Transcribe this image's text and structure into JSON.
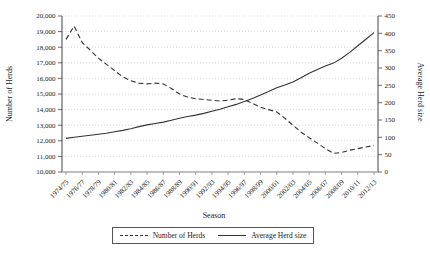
{
  "chart_data": {
    "type": "line",
    "xlabel": "Season",
    "ylabel_left": "Number of Herds",
    "ylabel_right": "Average Herd size",
    "grid": "dotted-horizontal",
    "legend_position": "bottom-center-boxed",
    "colors": {
      "line": "#333333",
      "grid": "#c9c9c9",
      "axis": "#444444",
      "bottom_axis": "#aaaaaa",
      "background": "#ffffff"
    },
    "x_categories": [
      "1974/75",
      "1975/76",
      "1976/77",
      "1977/78",
      "1978/79",
      "1979/80",
      "1980/81",
      "1981/82",
      "1982/83",
      "1983/84",
      "1984/85",
      "1985/86",
      "1986/87",
      "1987/88",
      "1988/89",
      "1989/90",
      "1990/91",
      "1991/92",
      "1992/93",
      "1993/94",
      "1994/95",
      "1995/96",
      "1996/97",
      "1997/98",
      "1998/99",
      "1999/00",
      "2000/01",
      "2001/02",
      "2002/03",
      "2003/04",
      "2004/05",
      "2005/06",
      "2006/07",
      "2007/08",
      "2008/09",
      "2009/10",
      "2010/11",
      "2011/12",
      "2012/13"
    ],
    "x_tick_labels": [
      "1974/75",
      "1976/77",
      "1978/79",
      "1980/81",
      "1982/83",
      "1984/85",
      "1986/87",
      "1988/89",
      "1990/91",
      "1992/93",
      "1994/95",
      "1996/97",
      "1998/99",
      "2000/01",
      "2002/03",
      "2004/05",
      "2006/07",
      "2008/09",
      "2010/11",
      "2012/13"
    ],
    "y_left": {
      "min": 10000,
      "max": 20000,
      "step": 1000,
      "tick_labels": [
        "10,000",
        "11,000",
        "12,000",
        "13,000",
        "14,000",
        "15,000",
        "16,000",
        "17,000",
        "18,000",
        "19,000",
        "20,000"
      ]
    },
    "y_right": {
      "min": 0,
      "max": 450,
      "step": 50,
      "tick_labels": [
        "0",
        "50",
        "100",
        "150",
        "200",
        "250",
        "300",
        "350",
        "400",
        "450"
      ]
    },
    "series": [
      {
        "name": "Number of Herds",
        "axis": "left",
        "style": "dashed",
        "values": [
          18500,
          19350,
          18300,
          17800,
          17300,
          16900,
          16500,
          16100,
          15850,
          15700,
          15650,
          15700,
          15650,
          15350,
          15000,
          14800,
          14700,
          14650,
          14600,
          14550,
          14600,
          14700,
          14650,
          14400,
          14150,
          14000,
          13850,
          13450,
          13000,
          12550,
          12200,
          11850,
          11500,
          11200,
          11250,
          11400,
          11500,
          11600,
          11700
        ]
      },
      {
        "name": "Average Herd size",
        "axis": "right",
        "style": "solid",
        "values": [
          97,
          100,
          103,
          106,
          109,
          112,
          116,
          120,
          125,
          131,
          136,
          140,
          144,
          149,
          155,
          160,
          164,
          169,
          175,
          181,
          188,
          195,
          203,
          212,
          222,
          232,
          243,
          251,
          260,
          272,
          285,
          296,
          306,
          314,
          328,
          345,
          364,
          383,
          402
        ]
      }
    ]
  },
  "legend": {
    "items": [
      {
        "label": "Number of Herds",
        "style": "dashed"
      },
      {
        "label": "Average Herd size",
        "style": "solid"
      }
    ]
  }
}
